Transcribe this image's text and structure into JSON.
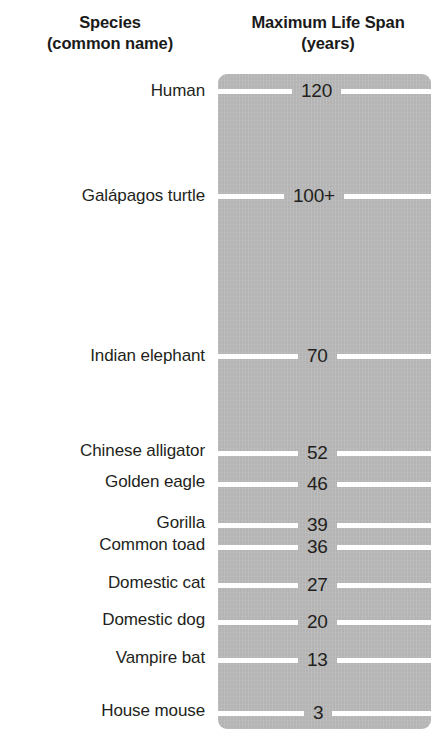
{
  "header": {
    "species_line1": "Species",
    "species_line2": "(common name)",
    "lifespan_line1": "Maximum Life Span",
    "lifespan_line2": "(years)"
  },
  "colors": {
    "panel_gray": "#b4b4b4",
    "tick_white": "#ffffff",
    "text": "#231f20"
  },
  "chart_data": {
    "type": "bar",
    "title": "Maximum Life Span (years)",
    "xlabel": "",
    "ylabel": "Maximum Life Span (years)",
    "orientation": "vertical-scale",
    "grid": true,
    "legend": null,
    "ylim": [
      0,
      130
    ],
    "categories": [
      "Human",
      "Galápagos turtle",
      "Indian elephant",
      "Chinese alligator",
      "Golden eagle",
      "Gorilla",
      "Common toad",
      "Domestic cat",
      "Domestic dog",
      "Vampire bat",
      "House mouse"
    ],
    "values": [
      120,
      100,
      70,
      52,
      46,
      39,
      36,
      27,
      20,
      13,
      3
    ],
    "value_labels": [
      "120",
      "100+",
      "70",
      "52",
      "46",
      "39",
      "36",
      "27",
      "20",
      "13",
      "3"
    ]
  },
  "rows": [
    {
      "species": "Human",
      "value": "120",
      "top": 78,
      "label_top": 78,
      "left_w": 74,
      "right_w": 74
    },
    {
      "species": "Galápagos turtle",
      "value": "100+",
      "top": 183,
      "label_top": 183,
      "left_w": 66,
      "right_w": 66
    },
    {
      "species": "Indian elephant",
      "value": "70",
      "top": 343,
      "label_top": 343,
      "left_w": 80,
      "right_w": 80
    },
    {
      "species": "Chinese alligator",
      "value": "52",
      "top": 440,
      "label_top": 438,
      "left_w": 80,
      "right_w": 80
    },
    {
      "species": "Golden eagle",
      "value": "46",
      "top": 471,
      "label_top": 469,
      "left_w": 80,
      "right_w": 80
    },
    {
      "species": "Gorilla",
      "value": "39",
      "top": 512,
      "label_top": 510,
      "left_w": 80,
      "right_w": 80
    },
    {
      "species": "Common toad",
      "value": "36",
      "top": 534,
      "label_top": 532,
      "left_w": 80,
      "right_w": 80
    },
    {
      "species": "Domestic cat",
      "value": "27",
      "top": 572,
      "label_top": 570,
      "left_w": 80,
      "right_w": 80
    },
    {
      "species": "Domestic dog",
      "value": "20",
      "top": 609,
      "label_top": 607,
      "left_w": 80,
      "right_w": 80
    },
    {
      "species": "Vampire bat",
      "value": "13",
      "top": 647,
      "label_top": 645,
      "left_w": 80,
      "right_w": 80
    },
    {
      "species": "House mouse",
      "value": "3",
      "top": 700,
      "label_top": 698,
      "left_w": 86,
      "right_w": 86
    }
  ]
}
